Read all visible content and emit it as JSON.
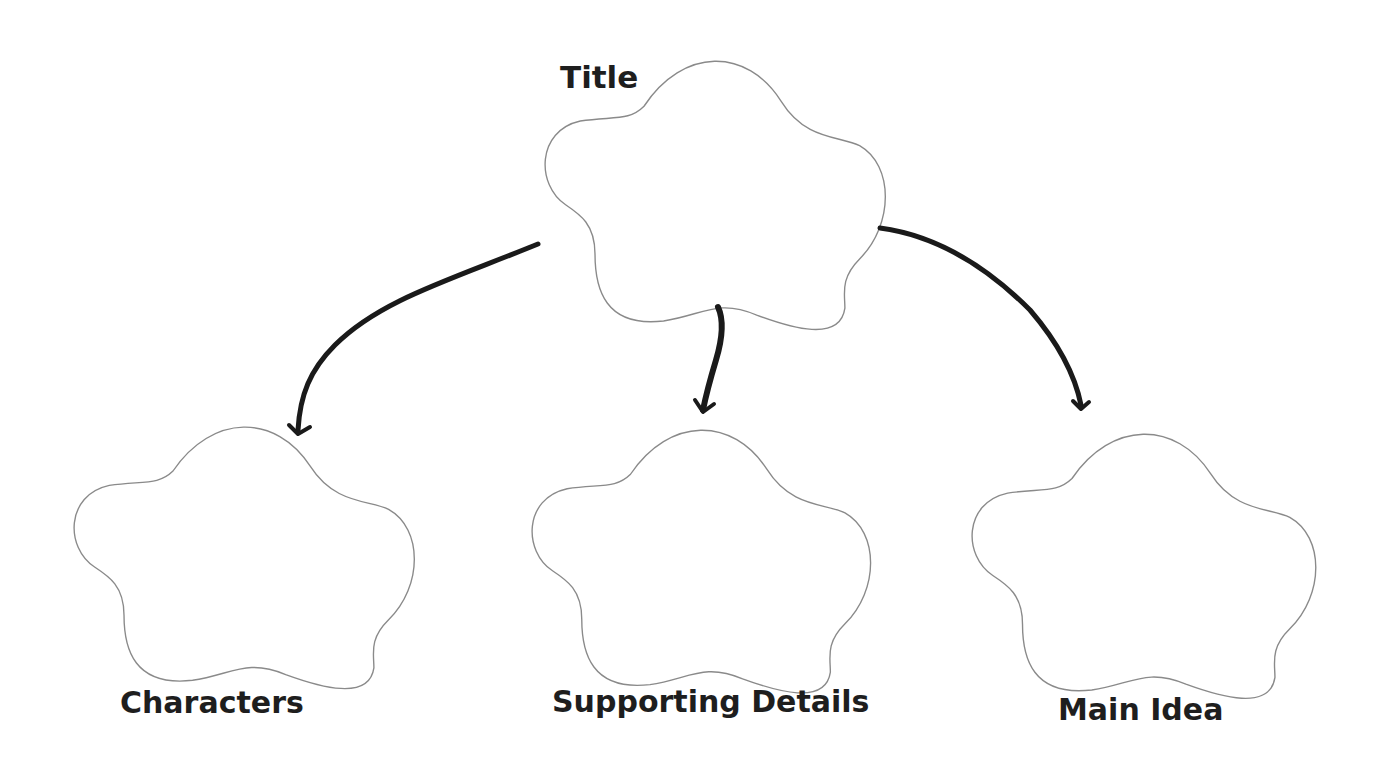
{
  "diagram": {
    "type": "graphic-organizer",
    "nodes": [
      {
        "id": "title",
        "label": "Title",
        "position": "top-center"
      },
      {
        "id": "characters",
        "label": "Characters",
        "position": "bottom-left"
      },
      {
        "id": "supporting_details",
        "label": "Supporting Details",
        "position": "bottom-center"
      },
      {
        "id": "main_idea",
        "label": "Main Idea",
        "position": "bottom-right"
      }
    ],
    "edges": [
      {
        "from": "title",
        "to": "characters"
      },
      {
        "from": "title",
        "to": "supporting_details"
      },
      {
        "from": "title",
        "to": "main_idea"
      }
    ],
    "colors": {
      "shape_outline": "#8a8a8a",
      "arrow": "#1a1a1a",
      "text": "#1e1e1e",
      "background": "#ffffff"
    }
  },
  "labels": {
    "title": "Title",
    "characters": "Characters",
    "supporting_details": "Supporting Details",
    "main_idea": "Main Idea"
  }
}
